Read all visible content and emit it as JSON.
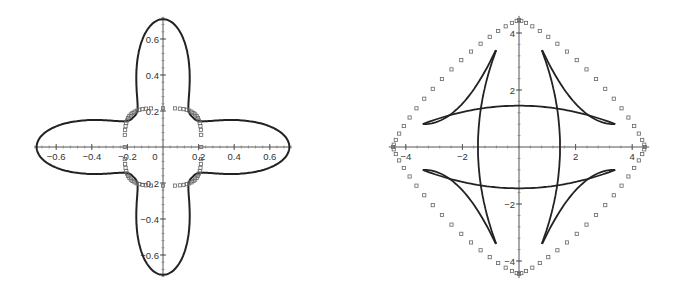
{
  "chart_data": [
    {
      "type": "line",
      "title": "",
      "xlabel": "",
      "ylabel": "",
      "xlim": [
        -0.72,
        0.72
      ],
      "ylim": [
        -0.72,
        0.72
      ],
      "grid": false,
      "x_ticks": [
        "-0.6",
        "-0.4",
        "-0.2",
        "0",
        "0.2",
        "0.4",
        "0.6"
      ],
      "y_ticks": [
        "0.6",
        "0.4",
        "0.2",
        "-0.2",
        "-0.4",
        "-0.6"
      ],
      "series": [
        {
          "name": "four-lobed curve (solid)",
          "style": "solid",
          "description": "Star/clover shape with four lobes reaching ±0.71 on each axis, pinched to ~0.23 near diagonals"
        },
        {
          "name": "rounded square (square markers)",
          "style": "markers",
          "description": "Rounded square of radius ~0.22 centered at origin"
        }
      ]
    },
    {
      "type": "line",
      "title": "",
      "xlabel": "",
      "ylabel": "",
      "xlim": [
        -4.5,
        4.5
      ],
      "ylim": [
        -4.5,
        4.5
      ],
      "grid": false,
      "x_ticks": [
        "-4",
        "-2",
        "2",
        "4"
      ],
      "y_ticks": [
        "4",
        "2",
        "-2",
        "-4"
      ],
      "series": [
        {
          "name": "astroid-like caustic (solid)",
          "style": "solid",
          "description": "Four cusped curves with cusps near (±3.4, ±0.8) and (±0.8, ±3.4), crossing arcs at x≈±1.4 and y≈±1.4"
        },
        {
          "name": "outer diamond (square markers)",
          "style": "markers",
          "description": "Rounded diamond reaching ±4.4 on each axis"
        }
      ]
    }
  ]
}
